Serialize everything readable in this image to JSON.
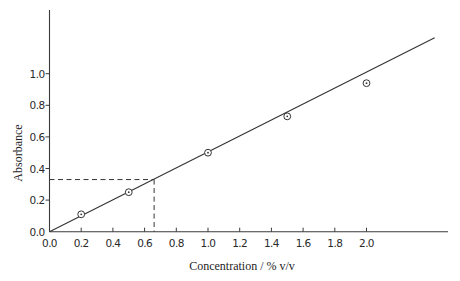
{
  "chart_data": {
    "type": "scatter",
    "title": "",
    "xlabel": "Concentration / % v/v",
    "ylabel": "Absorbance",
    "xlim": [
      0,
      2.5
    ],
    "ylim": [
      0,
      1.25
    ],
    "x_ticks": [
      "0.0",
      "0.2",
      "0.4",
      "0.6",
      "0.8",
      "1.0",
      "1.2",
      "1.4",
      "1.6",
      "1.8",
      "2.0"
    ],
    "x_tick_values": [
      0.0,
      0.2,
      0.4,
      0.6,
      0.8,
      1.0,
      1.2,
      1.4,
      1.6,
      1.8,
      2.0
    ],
    "y_ticks": [
      "0.0",
      "0.2",
      "0.4",
      "0.6",
      "0.8",
      "1.0"
    ],
    "y_tick_values": [
      0.0,
      0.2,
      0.4,
      0.6,
      0.8,
      1.0
    ],
    "grid": false,
    "legend": "none",
    "series": [
      {
        "name": "Measured standards",
        "marker": "circle-dot",
        "x": [
          0.2,
          0.5,
          1.0,
          1.5,
          2.0
        ],
        "y": [
          0.11,
          0.25,
          0.5,
          0.73,
          0.94
        ]
      }
    ],
    "fit_line": {
      "name": "Calibration line",
      "slope": 0.505,
      "intercept": 0.0,
      "x_range": [
        0.0,
        2.43
      ]
    },
    "annotations": [
      {
        "type": "dashed-interpolation",
        "x": 0.66,
        "y": 0.33,
        "description": "Unknown sample absorbance read off calibration line"
      }
    ]
  }
}
